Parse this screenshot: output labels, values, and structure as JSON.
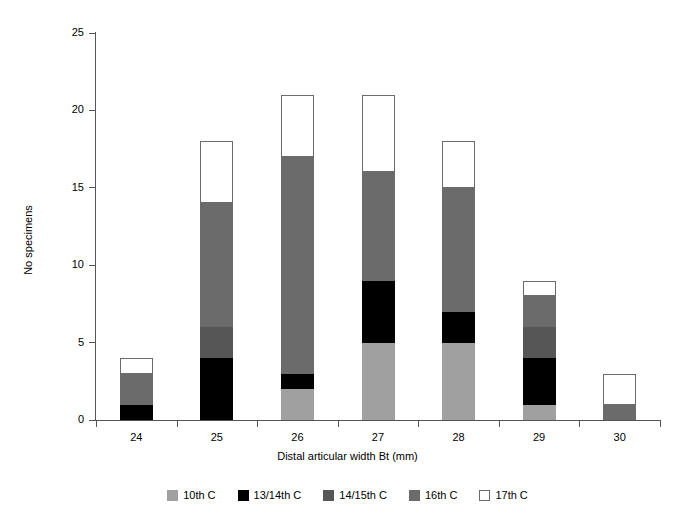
{
  "chart_data": {
    "type": "bar",
    "subtype": "stacked-bar",
    "title": "",
    "xlabel": "Distal articular width Bt (mm)",
    "ylabel": "No specimens",
    "categories": [
      "24",
      "25",
      "26",
      "27",
      "28",
      "29",
      "30"
    ],
    "ylim": [
      0,
      25
    ],
    "yticks": [
      "0",
      "5",
      "10",
      "15",
      "20",
      "25"
    ],
    "ytick_values": [
      0,
      5,
      10,
      15,
      20,
      25
    ],
    "grid": false,
    "legend_position": "bottom",
    "series": [
      {
        "name": "10th C",
        "color": "#a0a0a0",
        "values": [
          0,
          0,
          2,
          5,
          5,
          1,
          0
        ]
      },
      {
        "name": "13/14th C",
        "color": "#000000",
        "values": [
          1,
          4,
          1,
          4,
          2,
          3,
          0
        ]
      },
      {
        "name": "14/15th C",
        "color": "#565656",
        "values": [
          0,
          2,
          0,
          0,
          0,
          2,
          0
        ]
      },
      {
        "name": "16th C",
        "color": "#6b6b6b",
        "values": [
          2,
          8,
          14,
          7,
          8,
          2,
          1
        ]
      },
      {
        "name": "17th C",
        "color": "#ffffff",
        "values": [
          1,
          4,
          4,
          5,
          3,
          1,
          2
        ]
      }
    ],
    "totals": [
      4,
      18,
      21,
      21,
      18,
      9,
      3
    ]
  },
  "legend": {
    "items": [
      {
        "label": "10th C"
      },
      {
        "label": "13/14th C"
      },
      {
        "label": "14/15th C"
      },
      {
        "label": "16th C"
      },
      {
        "label": "17th C"
      }
    ]
  }
}
